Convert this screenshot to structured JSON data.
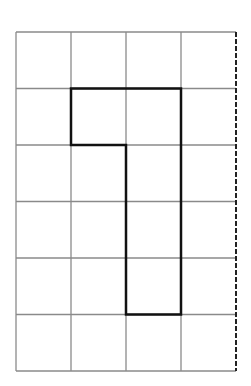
{
  "diagram": {
    "type": "grid-with-outlined-shape",
    "grid": {
      "columns": 4,
      "rows": 6,
      "left": 16,
      "top": 32,
      "cell_width": 55,
      "cell_height": 56.5,
      "line_color": "#8a8a8a"
    },
    "right_edge": {
      "style": "dashed",
      "color": "#222222"
    },
    "shape": {
      "description": "Bold outline: cells (row1,col1),(row1,col2) on top, then column 2 extending down rows 2-4",
      "cells": [
        [
          1,
          1
        ],
        [
          1,
          2
        ],
        [
          2,
          2
        ],
        [
          3,
          2
        ],
        [
          4,
          2
        ]
      ],
      "stroke_color": "#111111"
    }
  }
}
